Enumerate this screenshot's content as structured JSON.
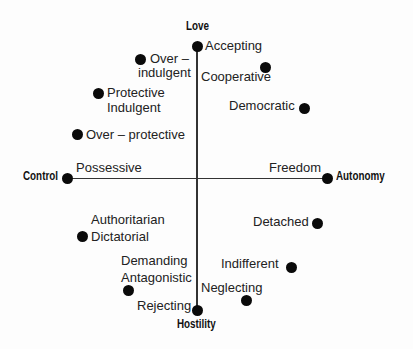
{
  "axes": {
    "top": "Love",
    "bottom": "Hostility",
    "left": "Control",
    "right": "Autonomy"
  },
  "points": [
    {
      "id": "accepting",
      "label": "Accepting",
      "x": 197,
      "y": 46
    },
    {
      "id": "over-indulgent",
      "label_line1": "Over –",
      "label_line2": "indulgent",
      "x": 140,
      "y": 59
    },
    {
      "id": "cooperative",
      "label": "Cooperative",
      "x": 265,
      "y": 67
    },
    {
      "id": "protective-indulgent",
      "label_line1": "Protective",
      "label_line2": "Indulgent",
      "x": 98,
      "y": 93
    },
    {
      "id": "democratic",
      "label": "Democratic",
      "x": 304,
      "y": 108
    },
    {
      "id": "over-protective",
      "label": "Over – protective",
      "x": 77,
      "y": 134
    },
    {
      "id": "possessive",
      "label": "Possessive",
      "x": 67,
      "y": 178
    },
    {
      "id": "freedom",
      "label": "Freedom",
      "x": 327,
      "y": 178
    },
    {
      "id": "detached",
      "label": "Detached",
      "x": 317,
      "y": 223
    },
    {
      "id": "authoritarian-dictatorial",
      "label_line1": "Authoritarian",
      "label_line2": "Dictatorial",
      "x": 82,
      "y": 236
    },
    {
      "id": "indifferent",
      "label": "Indifferent",
      "x": 291,
      "y": 267
    },
    {
      "id": "demanding-antagonistic",
      "label_line1": "Demanding",
      "label_line2": "Antagonistic",
      "x": 128,
      "y": 290
    },
    {
      "id": "neglecting",
      "label": "Neglecting",
      "x": 246,
      "y": 300
    },
    {
      "id": "rejecting",
      "label": "Rejecting",
      "x": 197,
      "y": 310
    }
  ]
}
